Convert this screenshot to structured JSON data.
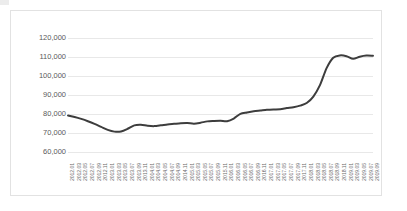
{
  "chart_data": {
    "type": "line",
    "title": "",
    "subtitle": "",
    "xlabel": "",
    "ylabel": "",
    "grid": "horizontal",
    "legend": "none",
    "ylim": [
      55000,
      122000
    ],
    "y_ticks": [
      60000,
      70000,
      80000,
      90000,
      100000,
      110000,
      120000
    ],
    "y_tick_labels": [
      "60,000",
      "70,000",
      "80,000",
      "90,000",
      "100,000",
      "110,000",
      "120,000"
    ],
    "line_color": "#3d3d3d",
    "line_width": 2,
    "markers": "none",
    "categories": [
      "2012.01",
      "2012.03",
      "2012.05",
      "2012.07",
      "2012.09",
      "2012.11",
      "2013.01",
      "2013.03",
      "2013.05",
      "2013.07",
      "2013.09",
      "2013.11",
      "2014.01",
      "2014.03",
      "2014.05",
      "2014.07",
      "2014.09",
      "2014.11",
      "2015.01",
      "2015.03",
      "2015.05",
      "2015.07",
      "2015.09",
      "2015.11",
      "2016.01",
      "2016.03",
      "2016.05",
      "2016.07",
      "2016.09",
      "2016.11",
      "2017.01",
      "2017.03",
      "2017.05",
      "2017.07",
      "2017.09",
      "2017.11",
      "2018.01",
      "2018.03",
      "2018.05",
      "2018.07",
      "2018.09",
      "2018.11",
      "2019.01",
      "2019.03",
      "2019.05",
      "2019.07",
      "2019.09"
    ],
    "values": [
      79000,
      78200,
      77200,
      76000,
      74600,
      73000,
      71400,
      70500,
      70600,
      72000,
      73800,
      74100,
      73600,
      73400,
      73800,
      74300,
      74600,
      74900,
      75000,
      74700,
      75200,
      75900,
      76100,
      76200,
      76000,
      77400,
      79900,
      80600,
      81200,
      81600,
      82000,
      82200,
      82300,
      82900,
      83400,
      84200,
      85600,
      89000,
      95000,
      104000,
      109500,
      110700,
      110300,
      108900,
      110000,
      110600,
      110500
    ],
    "series": [
      {
        "name": "series-1",
        "values": [
          79000,
          78200,
          77200,
          76000,
          74600,
          73000,
          71400,
          70500,
          70600,
          72000,
          73800,
          74100,
          73600,
          73400,
          73800,
          74300,
          74600,
          74900,
          75000,
          74700,
          75200,
          75900,
          76100,
          76200,
          76000,
          77400,
          79900,
          80600,
          81200,
          81600,
          82000,
          82200,
          82300,
          82900,
          83400,
          84200,
          85600,
          89000,
          95000,
          104000,
          109500,
          110700,
          110300,
          108900,
          110000,
          110600,
          110500
        ]
      }
    ],
    "annotations": []
  }
}
